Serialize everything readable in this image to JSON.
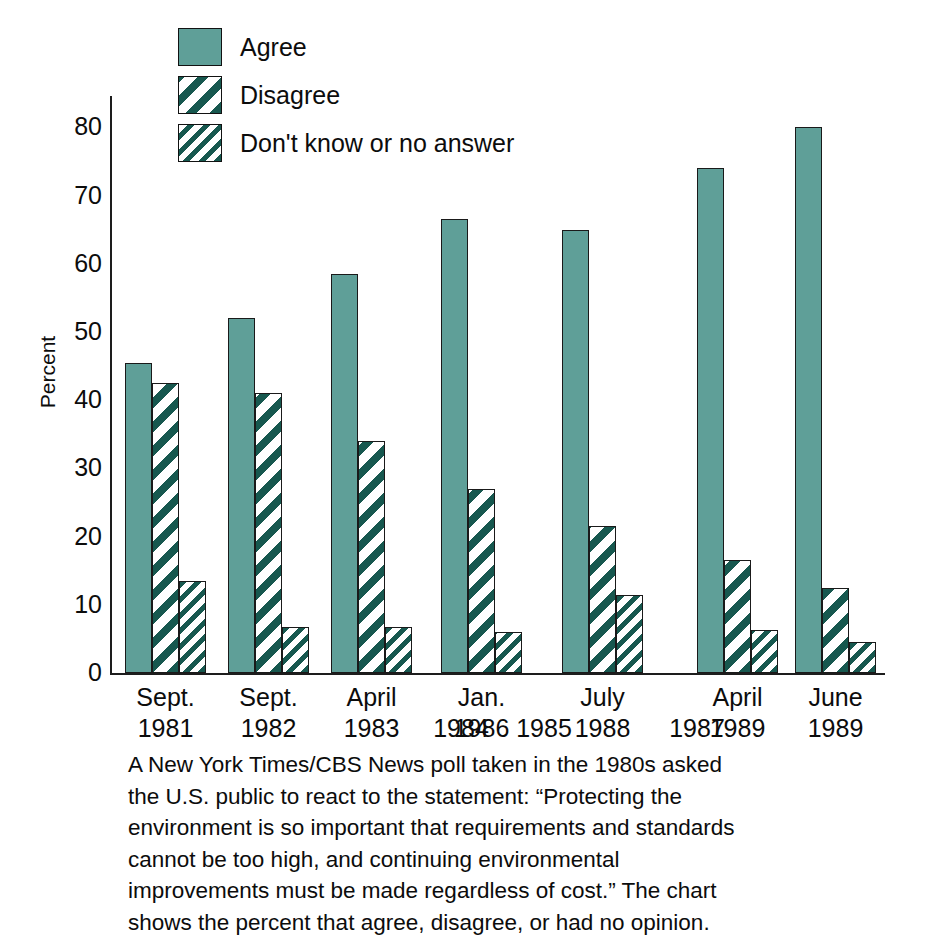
{
  "chart_data": {
    "type": "bar",
    "title": "",
    "xlabel": "",
    "ylabel": "Percent",
    "ylim": [
      0,
      80
    ],
    "ytick_labels": [
      "80",
      "70",
      "60",
      "50",
      "40",
      "30",
      "20",
      "10",
      "0"
    ],
    "ytick_values": [
      80,
      70,
      60,
      50,
      40,
      30,
      20,
      10,
      0
    ],
    "grid": false,
    "legend_position": "top-left",
    "categories": [
      "Sept. 1981",
      "Sept. 1982",
      "April 1983",
      "1984",
      "1985",
      "Jan. 1986",
      "1987",
      "July 1988",
      "April 1989",
      "June 1989"
    ],
    "category_parts": [
      {
        "month": "Sept.",
        "year": "1981",
        "has_data": true
      },
      {
        "month": "Sept.",
        "year": "1982",
        "has_data": true
      },
      {
        "month": "April",
        "year": "1983",
        "has_data": true
      },
      {
        "month": "",
        "year": "1984",
        "has_data": false
      },
      {
        "month": "",
        "year": "1985",
        "has_data": false
      },
      {
        "month": "Jan.",
        "year": "1986",
        "has_data": true
      },
      {
        "month": "",
        "year": "1987",
        "has_data": false
      },
      {
        "month": "July",
        "year": "1988",
        "has_data": true
      },
      {
        "month": "April",
        "year": "1989",
        "has_data": true
      },
      {
        "month": "June",
        "year": "1989",
        "has_data": true
      }
    ],
    "series": [
      {
        "name": "Agree",
        "pattern": "solid",
        "color": "#5f9f98",
        "values": [
          45.5,
          52.0,
          58.5,
          null,
          null,
          66.5,
          null,
          65.0,
          74.0,
          80.0
        ]
      },
      {
        "name": "Disagree",
        "pattern": "wide-diagonal-hatch",
        "color": "#17584f",
        "values": [
          42.5,
          41.0,
          34.0,
          null,
          null,
          27.0,
          null,
          21.5,
          16.5,
          12.5
        ]
      },
      {
        "name": "Don't know or no answer",
        "pattern": "fine-diagonal-hatch",
        "color": "#17584f",
        "values": [
          13.5,
          6.8,
          6.8,
          null,
          null,
          6.0,
          null,
          11.5,
          6.3,
          4.5
        ]
      }
    ]
  },
  "legend": {
    "items": [
      {
        "label": "Agree",
        "swatch": "solid"
      },
      {
        "label": "Disagree",
        "swatch": "wide-diagonal-hatch"
      },
      {
        "label": "Don't know or no answer",
        "swatch": "fine-diagonal-hatch"
      }
    ]
  },
  "caption": {
    "lines": [
      "A New York Times/CBS News poll taken in the 1980s asked",
      "the U.S. public to react to the statement: “Protecting the",
      "environment is so important that requirements and standards",
      "cannot be too high, and continuing environmental",
      "improvements must be made regardless of cost.” The chart",
      "shows the percent that agree, disagree, or had no opinion."
    ]
  },
  "colors": {
    "agree_fill": "#5f9f98",
    "hatch_dark": "#17584f",
    "axis": "#1d1d1d",
    "text": "#0c0c0c",
    "background": "#ffffff"
  }
}
